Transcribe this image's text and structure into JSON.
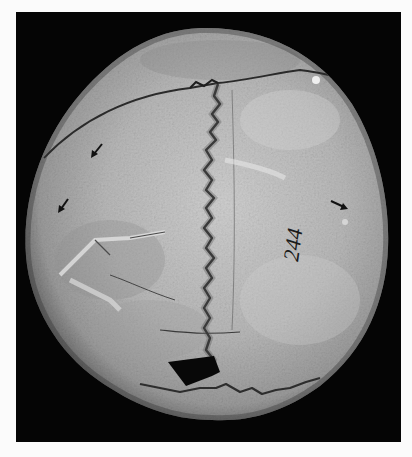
{
  "image": {
    "subject": "Superior view of a human skull (calvaria) with cranial sutures",
    "background_color": "#fbfbfb",
    "frame_color": "#050505",
    "bone_color_light": "#c9c9c9",
    "bone_color_mid": "#a4a4a4",
    "bone_color_dark": "#6c6c6c"
  },
  "annotations": {
    "specimen_number": "244",
    "arrows": [
      {
        "name": "arrow-upper-left",
        "x": 96,
        "y": 150,
        "direction": "down-left"
      },
      {
        "name": "arrow-left",
        "x": 63,
        "y": 205,
        "direction": "down-left"
      },
      {
        "name": "arrow-right",
        "x": 343,
        "y": 206,
        "direction": "down-right"
      }
    ]
  },
  "features": {
    "sagittal_suture": "vertical serrated suture running down center",
    "coronal_suture": "crack line across upper skull",
    "lambdoid_suture": "serrated line near lower edge",
    "defect": "dark triangular hole near bottom center"
  }
}
